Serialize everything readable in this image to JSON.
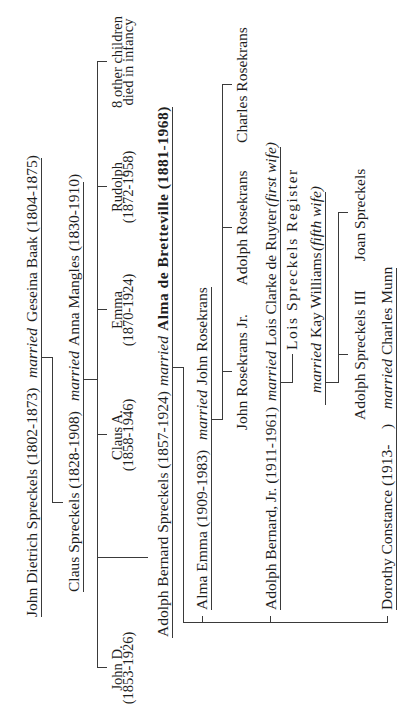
{
  "diagram": {
    "generation_1": {
      "husband": "John Dietrich Spreckels (1802-1873)",
      "relation": "married",
      "wife": "Geseina Baak (1804-1875)"
    },
    "generation_2": {
      "husband": "Claus Spreckels (1828-1908)",
      "relation": "married",
      "wife": "Anna Mangles (1830-1910)",
      "children": [
        {
          "name": "John D.",
          "detail": "(1853-1926)"
        },
        {
          "name": "Claus A.",
          "detail": "(1858-1946)"
        },
        {
          "name": "Emma",
          "detail": "(1870-1924)"
        },
        {
          "name": "Rudolph",
          "detail": "(1872-1958)"
        },
        {
          "name": "8 other children",
          "detail": "died in infancy"
        }
      ]
    },
    "generation_3": {
      "husband": "Adolph Bernard Spreckels (1857-1924)",
      "relation": "married",
      "wife": "Alma de Bretteville (1881-1968)"
    },
    "generation_4": {
      "alma_emma": {
        "name": "Alma Emma (1909-1983)",
        "relation": "married",
        "spouse": "John Rosekrans",
        "children": [
          "John Rosekrans Jr.",
          "Adolph Rosekrans",
          "Charles Rosekrans"
        ]
      },
      "adolph_jr": {
        "name": "Adolph Bernard, Jr. (1911-1961)",
        "relation": "married",
        "spouse": "Lois Clarke de Ruyter",
        "spouse_note": "(first wife)",
        "child": "Lois Spreckels Register",
        "second_relation": "married",
        "second_spouse": "Kay Williams",
        "second_spouse_note": "(fifth wife)",
        "second_children": [
          "Adolph Spreckels III",
          "Joan Spreckels"
        ]
      },
      "dorothy": {
        "name": "Dorothy Constance (1913-",
        "name_close": ")",
        "relation": "married",
        "spouse": "Charles Munn"
      }
    }
  }
}
